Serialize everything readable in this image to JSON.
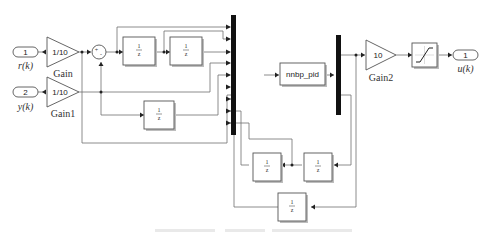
{
  "diagram": {
    "type": "simulink_block_diagram",
    "inports": [
      {
        "number": "1",
        "signal": "r(k)"
      },
      {
        "number": "2",
        "signal": "y(k)"
      }
    ],
    "outports": [
      {
        "number": "1",
        "signal": "u(k)"
      }
    ],
    "gains": [
      {
        "name": "Gain",
        "value": "1/10"
      },
      {
        "name": "Gain1",
        "value": "1/10"
      },
      {
        "name": "Gain2",
        "value": "10"
      }
    ],
    "sum": {
      "signs": "+-"
    },
    "unit_delays": [
      {
        "id": "delay_1",
        "num": "1",
        "den": "z"
      },
      {
        "id": "delay_2",
        "num": "1",
        "den": "z"
      },
      {
        "id": "delay_3",
        "num": "1",
        "den": "z"
      },
      {
        "id": "delay_4",
        "num": "1",
        "den": "z"
      },
      {
        "id": "delay_5",
        "num": "1",
        "den": "z"
      },
      {
        "id": "delay_6",
        "num": "1",
        "den": "z"
      }
    ],
    "subsystem": {
      "name": "nnbp_pid"
    },
    "saturation": {
      "name": "Saturation"
    },
    "mux": {
      "inputs": 9
    },
    "demux": {
      "outputs": 2
    }
  }
}
